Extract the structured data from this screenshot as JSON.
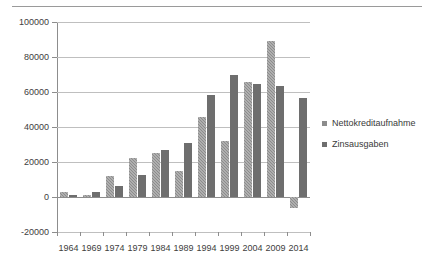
{
  "chart_data": {
    "type": "bar",
    "title": "",
    "subtitle": "",
    "xlabel": "",
    "ylabel": "",
    "categories": [
      "1964",
      "1969",
      "1974",
      "1979",
      "1984",
      "1989",
      "1994",
      "1999",
      "2004",
      "2009",
      "2014"
    ],
    "series": [
      {
        "name": "Nettokreditaufnahme",
        "color": "#8c8c8c",
        "values": [
          2600,
          1300,
          11800,
          22300,
          25200,
          14800,
          46000,
          31800,
          65500,
          89000,
          -6500
        ]
      },
      {
        "name": "Zinsausgaben",
        "color": "#6e6e6e",
        "values": [
          1400,
          3100,
          6300,
          12800,
          27100,
          31100,
          58300,
          69900,
          64800,
          63200,
          56500
        ]
      }
    ],
    "ylim": [
      -20000,
      100000
    ],
    "ytick_values": [
      -20000,
      0,
      20000,
      40000,
      60000,
      80000,
      100000
    ],
    "ytick_labels": [
      "-20000",
      "0",
      "20000",
      "40000",
      "60000",
      "80000",
      "100000"
    ],
    "grid": true,
    "legend_position": "right",
    "annotations": []
  },
  "legend": {
    "items": [
      {
        "label": "Nettokreditaufnahme",
        "color": "#8c8c8c"
      },
      {
        "label": "Zinsausgaben",
        "color": "#6e6e6e"
      }
    ]
  }
}
